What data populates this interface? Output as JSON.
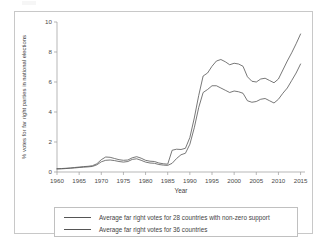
{
  "figure": {
    "frame": true,
    "background": "#ffffff",
    "line_color": "#555555"
  },
  "legend": {
    "position": "below-axes",
    "entries": [
      {
        "label": "Average far right votes for 28 countries with non-zero support",
        "color": "#555555"
      },
      {
        "label": "Average far right votes for 36 countries",
        "color": "#555555"
      }
    ]
  },
  "chart_data": {
    "type": "line",
    "title": "",
    "xlabel": "Year",
    "ylabel": "% votes for far right parties in national elections",
    "xlim": [
      1960,
      2016
    ],
    "ylim": [
      0,
      10
    ],
    "xticks": [
      1960,
      1965,
      1970,
      1975,
      1980,
      1985,
      1990,
      1995,
      2000,
      2005,
      2010,
      2015
    ],
    "yticks": [
      0,
      2,
      4,
      6,
      8,
      10
    ],
    "xticklabels": [
      "1960",
      "1965",
      "1970",
      "1975",
      "1980",
      "1985",
      "1990",
      "1995",
      "2000",
      "2005",
      "2010",
      "2015"
    ],
    "yticklabels": [
      "0",
      "2",
      "4",
      "6",
      "8",
      "10"
    ],
    "grid": false,
    "legend_position": "below",
    "x": [
      1960,
      1961,
      1962,
      1963,
      1964,
      1965,
      1966,
      1967,
      1968,
      1969,
      1970,
      1971,
      1972,
      1973,
      1974,
      1975,
      1976,
      1977,
      1978,
      1979,
      1980,
      1981,
      1982,
      1983,
      1984,
      1985,
      1986,
      1987,
      1988,
      1989,
      1990,
      1991,
      1992,
      1993,
      1994,
      1995,
      1996,
      1997,
      1998,
      1999,
      2000,
      2001,
      2002,
      2003,
      2004,
      2005,
      2006,
      2007,
      2008,
      2009,
      2010,
      2011,
      2012,
      2013,
      2014,
      2015
    ],
    "series": [
      {
        "name": "Average far right votes for 28 countries with non-zero support",
        "values": [
          0.22,
          0.23,
          0.25,
          0.27,
          0.3,
          0.33,
          0.36,
          0.38,
          0.42,
          0.55,
          0.82,
          1.0,
          0.98,
          0.9,
          0.82,
          0.78,
          0.8,
          0.95,
          1.02,
          0.92,
          0.78,
          0.72,
          0.7,
          0.6,
          0.55,
          0.52,
          1.45,
          1.52,
          1.5,
          1.58,
          2.3,
          3.6,
          5.1,
          6.4,
          6.6,
          7.05,
          7.4,
          7.5,
          7.35,
          7.15,
          7.25,
          7.2,
          7.05,
          6.35,
          6.05,
          6.0,
          6.2,
          6.25,
          6.1,
          5.95,
          6.2,
          6.8,
          7.4,
          7.95,
          8.55,
          9.2
        ]
      },
      {
        "name": "Average far right votes for 36 countries",
        "values": [
          0.2,
          0.21,
          0.23,
          0.25,
          0.27,
          0.3,
          0.32,
          0.34,
          0.37,
          0.48,
          0.68,
          0.78,
          0.8,
          0.76,
          0.7,
          0.66,
          0.7,
          0.84,
          0.88,
          0.78,
          0.66,
          0.6,
          0.58,
          0.5,
          0.46,
          0.44,
          0.58,
          0.9,
          1.15,
          1.25,
          1.85,
          2.95,
          4.3,
          5.3,
          5.5,
          5.75,
          5.75,
          5.6,
          5.45,
          5.3,
          5.4,
          5.35,
          5.25,
          4.75,
          4.65,
          4.7,
          4.85,
          4.9,
          4.75,
          4.6,
          4.85,
          5.25,
          5.6,
          6.1,
          6.6,
          7.2
        ]
      }
    ]
  }
}
